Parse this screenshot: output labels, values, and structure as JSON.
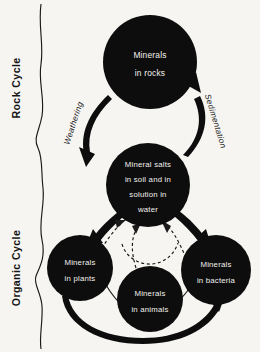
{
  "diagram": {
    "background_color": "#f6f5f2",
    "node_fill_color": "#0d0d0d",
    "node_text_color": "#f2f1ee",
    "line_color": "#1a1a1a",
    "sections": [
      {
        "id": "rock-cycle",
        "label": "Rock Cycle"
      },
      {
        "id": "organic-cycle",
        "label": "Organic Cycle"
      }
    ],
    "nodes": [
      {
        "id": "minerals-in-rocks",
        "lines": [
          "Minerals",
          "in  rocks"
        ],
        "cx": 150,
        "cy": 62,
        "r": 47
      },
      {
        "id": "mineral-salts",
        "lines": [
          "Mineral salts",
          "in soil and in",
          "solution in",
          "water"
        ],
        "cx": 148,
        "cy": 185,
        "r": 42
      },
      {
        "id": "minerals-in-plants",
        "lines": [
          "Minerals",
          "in plants"
        ],
        "cx": 80,
        "cy": 268,
        "r": 33
      },
      {
        "id": "minerals-in-animals",
        "lines": [
          "Minerals",
          "in animals"
        ],
        "cx": 150,
        "cy": 299,
        "r": 33
      },
      {
        "id": "minerals-in-bacteria",
        "lines": [
          "Minerals",
          "in bacteria"
        ],
        "cx": 216,
        "cy": 270,
        "r": 35
      }
    ],
    "arc_labels": [
      {
        "id": "weathering",
        "text": "Weathering"
      },
      {
        "id": "sedimentation",
        "text": "Sedimentation"
      }
    ],
    "flows": [
      {
        "id": "rocks-to-salts",
        "from": "minerals-in-rocks",
        "to": "mineral-salts",
        "label": "Weathering",
        "style": "thick"
      },
      {
        "id": "salts-to-rocks",
        "from": "mineral-salts",
        "to": "minerals-in-rocks",
        "label": "Sedimentation",
        "style": "thick"
      },
      {
        "id": "salts-to-plants",
        "from": "mineral-salts",
        "to": "minerals-in-plants",
        "label": "",
        "style": "thick"
      },
      {
        "id": "salts-to-bacteria",
        "from": "mineral-salts",
        "to": "minerals-in-bacteria",
        "label": "",
        "style": "thick"
      },
      {
        "id": "plants-to-animals",
        "from": "minerals-in-plants",
        "to": "minerals-in-animals",
        "label": "",
        "style": "thin"
      },
      {
        "id": "animals-to-bacteria",
        "from": "minerals-in-animals",
        "to": "minerals-in-bacteria",
        "label": "",
        "style": "thin"
      },
      {
        "id": "plants-to-bacteria",
        "from": "minerals-in-plants",
        "to": "minerals-in-bacteria",
        "label": "",
        "style": "thick"
      },
      {
        "id": "plants-to-salts",
        "from": "minerals-in-plants",
        "to": "mineral-salts",
        "label": "",
        "style": "dashed"
      },
      {
        "id": "animals-to-salts",
        "from": "minerals-in-animals",
        "to": "mineral-salts",
        "label": "",
        "style": "dashed"
      },
      {
        "id": "bacteria-to-salts",
        "from": "minerals-in-bacteria",
        "to": "mineral-salts",
        "label": "",
        "style": "dashed"
      }
    ]
  }
}
